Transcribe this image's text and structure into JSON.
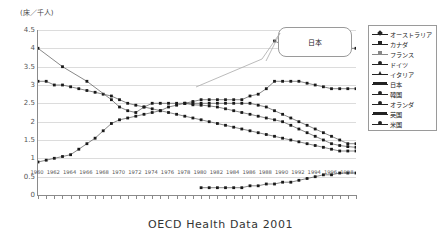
{
  "axis_unit_label": "(床／千人)",
  "caption": "OECD Health Data 2001",
  "callout": {
    "label": "日本"
  },
  "legend": {
    "items": [
      {
        "label": "オーストラリア",
        "marker": "diamond",
        "color": "#222222"
      },
      {
        "label": "カナダ",
        "marker": "square",
        "color": "#222222"
      },
      {
        "label": "フランス",
        "marker": "square",
        "color": "#888888"
      },
      {
        "label": "ドイツ",
        "marker": "circle",
        "color": "#222222"
      },
      {
        "label": "イタリア",
        "marker": "cross",
        "color": "#222222"
      },
      {
        "label": "日本",
        "marker": "bar",
        "color": "#222222"
      },
      {
        "label": "韓国",
        "marker": "circle",
        "color": "#222222"
      },
      {
        "label": "オランダ",
        "marker": "circle",
        "color": "#222222"
      },
      {
        "label": "英国",
        "marker": "bar",
        "color": "#222222"
      },
      {
        "label": "米国",
        "marker": "circle",
        "color": "#222222"
      }
    ]
  },
  "chart_data": {
    "type": "line",
    "title": "",
    "xlabel": "",
    "ylabel": "(床／千人)",
    "ylim": [
      0,
      4.5
    ],
    "ytick_labels": [
      "0",
      "0.5",
      "1",
      "1.5",
      "2",
      "2.5",
      "3",
      "3.5",
      "4",
      "4.5"
    ],
    "ytick_values": [
      0,
      0.5,
      1,
      1.5,
      2,
      2.5,
      3,
      3.5,
      4,
      4.5
    ],
    "grid": true,
    "legend_position": "right",
    "xlim": [
      1960,
      1999
    ],
    "x": [
      1960,
      1961,
      1962,
      1963,
      1964,
      1965,
      1966,
      1967,
      1968,
      1969,
      1970,
      1971,
      1972,
      1973,
      1974,
      1975,
      1976,
      1977,
      1978,
      1979,
      1980,
      1981,
      1982,
      1983,
      1984,
      1985,
      1986,
      1987,
      1988,
      1989,
      1990,
      1991,
      1992,
      1993,
      1994,
      1995,
      1996,
      1997,
      1998,
      1999
    ],
    "xtick_labels": [
      "1960",
      "1962",
      "1964",
      "1966",
      "1968",
      "1970",
      "1972",
      "1974",
      "1976",
      "1978",
      "1980",
      "1982",
      "1984",
      "1986",
      "1988",
      "1990",
      "1992",
      "1994",
      "1996",
      "1998"
    ],
    "series": [
      {
        "name": "オーストラリア",
        "values": [
          null,
          null,
          null,
          null,
          null,
          null,
          null,
          null,
          null,
          null,
          null,
          null,
          null,
          null,
          null,
          null,
          null,
          null,
          null,
          null,
          null,
          null,
          null,
          null,
          null,
          null,
          null,
          null,
          null,
          4.2,
          4.1,
          4.05,
          4.0,
          4.0,
          4.0,
          4.0,
          4.0,
          4.0,
          4.0,
          4.0
        ]
      },
      {
        "name": "カナダ",
        "values": [
          null,
          null,
          null,
          null,
          null,
          null,
          null,
          null,
          null,
          null,
          null,
          null,
          null,
          null,
          null,
          null,
          null,
          null,
          2.5,
          2.46,
          2.45,
          2.43,
          2.4,
          2.35,
          2.3,
          2.25,
          2.2,
          2.15,
          2.1,
          2.05,
          2.0,
          1.9,
          1.8,
          1.7,
          1.6,
          1.5,
          1.4,
          1.35,
          1.32,
          1.3
        ]
      },
      {
        "name": "フランス",
        "values": [
          null,
          null,
          null,
          null,
          null,
          null,
          null,
          null,
          null,
          null,
          null,
          null,
          null,
          null,
          null,
          null,
          null,
          null,
          null,
          null,
          null,
          null,
          null,
          null,
          null,
          null,
          null,
          null,
          null,
          null,
          null,
          null,
          null,
          null,
          null,
          null,
          null,
          null,
          null,
          null
        ]
      },
      {
        "name": "ドイツ",
        "values": [
          null,
          null,
          null,
          null,
          null,
          null,
          null,
          null,
          null,
          null,
          null,
          null,
          null,
          null,
          null,
          null,
          null,
          null,
          null,
          null,
          null,
          null,
          null,
          null,
          null,
          null,
          null,
          null,
          null,
          null,
          null,
          null,
          null,
          null,
          null,
          null,
          null,
          null,
          null,
          null
        ]
      },
      {
        "name": "イタリア",
        "values": [
          null,
          null,
          null,
          null,
          null,
          null,
          null,
          null,
          null,
          null,
          null,
          null,
          null,
          null,
          null,
          null,
          null,
          null,
          null,
          null,
          null,
          null,
          null,
          null,
          null,
          null,
          null,
          null,
          null,
          null,
          null,
          null,
          null,
          null,
          null,
          null,
          null,
          null,
          null,
          null
        ]
      },
      {
        "name": "日本",
        "values": [
          0.9,
          0.95,
          1.0,
          1.05,
          1.1,
          1.25,
          1.4,
          1.55,
          1.75,
          1.95,
          2.05,
          2.1,
          2.15,
          2.2,
          2.25,
          2.3,
          2.4,
          2.45,
          2.5,
          2.55,
          2.6,
          2.6,
          2.6,
          2.6,
          2.6,
          2.6,
          2.7,
          2.75,
          2.9,
          3.1,
          3.1,
          3.1,
          3.1,
          3.05,
          3.0,
          2.95,
          2.9,
          2.9,
          2.9,
          2.9
        ]
      },
      {
        "name": "韓国",
        "values": [
          null,
          null,
          null,
          null,
          null,
          null,
          null,
          null,
          null,
          null,
          null,
          null,
          null,
          null,
          null,
          null,
          null,
          null,
          null,
          null,
          0.2,
          0.2,
          0.2,
          0.2,
          0.2,
          0.2,
          0.25,
          0.25,
          0.3,
          0.3,
          0.35,
          0.35,
          0.4,
          0.45,
          0.5,
          0.55,
          0.55,
          0.6,
          0.6,
          0.6
        ]
      },
      {
        "name": "オランダ",
        "values": [
          3.1,
          3.1,
          3.0,
          3.0,
          2.95,
          2.9,
          2.85,
          2.8,
          2.75,
          2.7,
          2.6,
          2.5,
          2.45,
          2.4,
          2.35,
          2.3,
          2.25,
          2.2,
          2.15,
          2.1,
          2.05,
          2.0,
          1.95,
          1.9,
          1.85,
          1.8,
          1.75,
          1.7,
          1.65,
          1.6,
          1.55,
          1.5,
          1.45,
          1.4,
          1.35,
          1.3,
          1.25,
          1.2,
          1.2,
          1.2
        ]
      },
      {
        "name": "英国",
        "values": [
          4.0,
          null,
          null,
          3.5,
          null,
          null,
          3.1,
          null,
          null,
          2.6,
          2.4,
          2.3,
          2.25,
          2.4,
          2.5,
          2.5,
          2.5,
          2.5,
          2.5,
          2.5,
          2.5,
          2.5,
          2.5,
          2.5,
          2.5,
          2.5,
          2.5,
          2.45,
          2.4,
          2.3,
          2.2,
          2.1,
          2.0,
          1.9,
          1.8,
          1.7,
          1.6,
          1.5,
          1.4,
          1.4
        ]
      },
      {
        "name": "米国",
        "values": [
          null,
          null,
          null,
          null,
          null,
          null,
          null,
          null,
          null,
          null,
          null,
          null,
          null,
          null,
          null,
          null,
          null,
          null,
          null,
          null,
          null,
          null,
          null,
          null,
          null,
          null,
          null,
          null,
          null,
          null,
          null,
          null,
          null,
          null,
          null,
          null,
          null,
          null,
          null,
          null
        ]
      }
    ]
  }
}
